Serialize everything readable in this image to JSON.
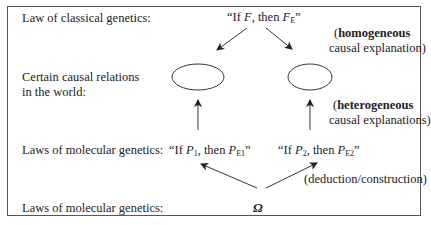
{
  "rows": {
    "row1_label": "Law of classical genetics:",
    "row2_label_line1": "Certain causal relations",
    "row2_label_line2": "in the world:",
    "row3_label": "Laws of molecular genetics:",
    "row4_label": "Laws of molecular genetics:"
  },
  "classical_law": {
    "open_quote": "“If ",
    "var": "F",
    "middle": ", then ",
    "var2": "F",
    "sub2": "E",
    "close_quote": "”"
  },
  "molecular_law_1": {
    "open_quote": "“If ",
    "var": "P",
    "sub": "1",
    "middle": ", then ",
    "var2": "P",
    "sub2": "E1",
    "close_quote": "”"
  },
  "molecular_law_2": {
    "open_quote": "“If ",
    "var": "P",
    "sub": "2",
    "middle": ", then ",
    "var2": "P",
    "sub2": "E2",
    "close_quote": "”"
  },
  "omega": "Ω",
  "annotations": {
    "homogeneous_open": "(",
    "homogeneous_bold": "homogeneous",
    "homogeneous_line2": "causal explanation)",
    "heterogeneous_open": "(",
    "heterogeneous_bold": "heterogeneous",
    "heterogeneous_line2": "causal explanations)",
    "deduction": "(deduction/construction)"
  },
  "colors": {
    "line": "#333333",
    "border": "#555555",
    "text": "#222222"
  }
}
